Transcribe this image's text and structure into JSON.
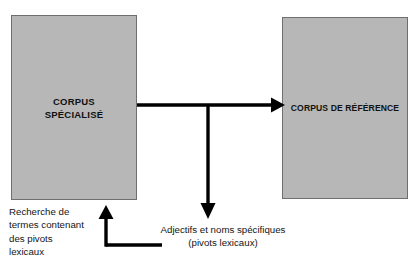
{
  "diagram": {
    "background_color": "#ffffff",
    "box_fill_color": "#b7b7b7",
    "box_border_color": "#6f6f6f",
    "arrow_color": "#000000",
    "text_color": "#141414",
    "boxes": [
      {
        "id": "corpus-specialise",
        "label": "CORPUS\nSPÉCIALISÉ"
      },
      {
        "id": "corpus-reference",
        "label": "CORPUS DE RÉFÉRENCE"
      }
    ],
    "captions": [
      {
        "id": "recherche",
        "text": "Recherche de\ntermes contenant\ndes pivots\nlexicaux"
      },
      {
        "id": "adjectifs",
        "text": "Adjectifs et noms spécifiques\n(pivots lexicaux)"
      }
    ],
    "connectors": [
      {
        "id": "specialise-to-reference",
        "direction": "right"
      },
      {
        "id": "branch-down-to-adjectifs",
        "direction": "down"
      },
      {
        "id": "recherche-back-to-specialise",
        "direction": "up"
      }
    ]
  }
}
